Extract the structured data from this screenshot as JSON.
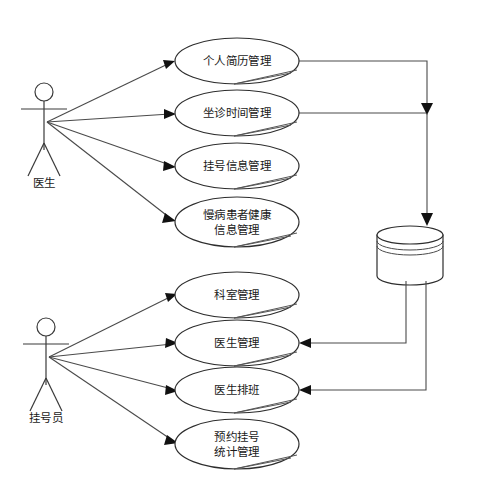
{
  "diagram": {
    "type": "uml-use-case-diagram",
    "background_color": "#ffffff",
    "line_color": "#4a4a4a",
    "text_color": "#1a1a1a",
    "actors": [
      {
        "id": "doctor",
        "label": "医生",
        "x": 44,
        "y": 120,
        "label_x": 44,
        "label_y": 182
      },
      {
        "id": "registrar",
        "label": "挂号员",
        "x": 44,
        "y": 355,
        "label_x": 46,
        "label_y": 417
      }
    ],
    "use_cases": [
      {
        "id": "uc1",
        "lines": [
          "个人简历管理"
        ],
        "cx": 237,
        "cy": 61,
        "rx": 62,
        "ry": 23
      },
      {
        "id": "uc2",
        "lines": [
          "坐诊时间管理"
        ],
        "cx": 237,
        "cy": 113,
        "rx": 62,
        "ry": 23
      },
      {
        "id": "uc3",
        "lines": [
          "挂号信息管理"
        ],
        "cx": 237,
        "cy": 166,
        "rx": 62,
        "ry": 23
      },
      {
        "id": "uc4",
        "lines": [
          "慢病患者健康",
          "信息管理"
        ],
        "cx": 237,
        "cy": 222,
        "rx": 62,
        "ry": 25
      },
      {
        "id": "uc5",
        "lines": [
          "科室管理"
        ],
        "cx": 237,
        "cy": 295,
        "rx": 62,
        "ry": 23
      },
      {
        "id": "uc6",
        "lines": [
          "医生管理"
        ],
        "cx": 237,
        "cy": 343,
        "rx": 62,
        "ry": 23
      },
      {
        "id": "uc7",
        "lines": [
          "医生排班"
        ],
        "cx": 237,
        "cy": 390,
        "rx": 62,
        "ry": 23
      },
      {
        "id": "uc8",
        "lines": [
          "预约挂号",
          "统计管理"
        ],
        "cx": 237,
        "cy": 444,
        "rx": 62,
        "ry": 25
      }
    ],
    "datastore": {
      "id": "database",
      "label": "",
      "cx": 410,
      "top_y": 226,
      "bottom_y": 276,
      "rx": 33,
      "ry": 9
    },
    "associations": [
      {
        "from": "doctor",
        "to": "uc1",
        "direction": "to-use-case"
      },
      {
        "from": "doctor",
        "to": "uc2",
        "direction": "to-use-case"
      },
      {
        "from": "doctor",
        "to": "uc3",
        "direction": "to-use-case"
      },
      {
        "from": "doctor",
        "to": "uc4",
        "direction": "to-use-case"
      },
      {
        "from": "registrar",
        "to": "uc5",
        "direction": "to-use-case"
      },
      {
        "from": "registrar",
        "to": "uc6",
        "direction": "to-use-case"
      },
      {
        "from": "registrar",
        "to": "uc7",
        "direction": "to-use-case"
      },
      {
        "from": "registrar",
        "to": "uc8",
        "direction": "to-use-case"
      },
      {
        "from": "uc1",
        "to": "database",
        "direction": "to-datastore"
      },
      {
        "from": "uc2",
        "to": "database",
        "direction": "to-datastore"
      },
      {
        "from": "database",
        "to": "uc6",
        "direction": "to-use-case"
      },
      {
        "from": "database",
        "to": "uc7",
        "direction": "to-use-case"
      }
    ]
  }
}
